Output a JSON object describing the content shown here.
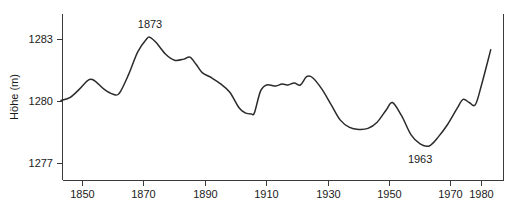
{
  "chart_data": {
    "type": "line",
    "title": "",
    "xlabel": "",
    "ylabel": "Höhe (m)",
    "xlim": [
      1843,
      1983
    ],
    "ylim": [
      1276.0,
      1283.7
    ],
    "grid": false,
    "legend": null,
    "x_ticks": [
      1850,
      1870,
      1890,
      1910,
      1930,
      1950,
      1970,
      1980
    ],
    "x_tick_labels": [
      "1850",
      "1870",
      "1890",
      "1910",
      "1930",
      "1950",
      "1970",
      "1980"
    ],
    "y_ticks": [
      1277,
      1280,
      1283
    ],
    "y_tick_labels": [
      "1277",
      "1280",
      "1283"
    ],
    "annotations": [
      {
        "text": "1873",
        "x": 1872,
        "y": 1283.1,
        "placement": "above"
      },
      {
        "text": "1963",
        "x": 1960,
        "y": 1277.85,
        "placement": "below"
      }
    ],
    "series": [
      {
        "name": "Seespiegel",
        "x": [
          1843,
          1846,
          1849,
          1852,
          1854,
          1857,
          1860,
          1862,
          1865,
          1868,
          1871,
          1872,
          1874,
          1877,
          1880,
          1883,
          1885,
          1887,
          1889,
          1892,
          1895,
          1898,
          1901,
          1903,
          1905,
          1906,
          1908,
          1910,
          1913,
          1915,
          1917,
          1919,
          1921,
          1923,
          1925,
          1928,
          1931,
          1934,
          1937,
          1940,
          1943,
          1946,
          1949,
          1951,
          1954,
          1957,
          1960,
          1963,
          1966,
          1969,
          1972,
          1974,
          1976,
          1978,
          1980,
          1983
        ],
        "y": [
          1280.05,
          1280.2,
          1280.6,
          1281.05,
          1281.0,
          1280.6,
          1280.35,
          1280.4,
          1281.3,
          1282.4,
          1283.05,
          1283.1,
          1282.85,
          1282.3,
          1282.0,
          1282.05,
          1282.15,
          1281.8,
          1281.4,
          1281.15,
          1280.85,
          1280.45,
          1279.7,
          1279.45,
          1279.4,
          1279.45,
          1280.5,
          1280.8,
          1280.75,
          1280.85,
          1280.8,
          1280.9,
          1280.8,
          1281.2,
          1281.15,
          1280.6,
          1279.85,
          1279.1,
          1278.75,
          1278.65,
          1278.7,
          1279.0,
          1279.6,
          1279.95,
          1279.3,
          1278.4,
          1277.95,
          1277.85,
          1278.3,
          1278.9,
          1279.65,
          1280.1,
          1279.95,
          1279.85,
          1280.8,
          1282.5
        ]
      }
    ]
  },
  "axis": {
    "y_label": "Höhe (m)"
  },
  "caption": {
    "text": ""
  }
}
